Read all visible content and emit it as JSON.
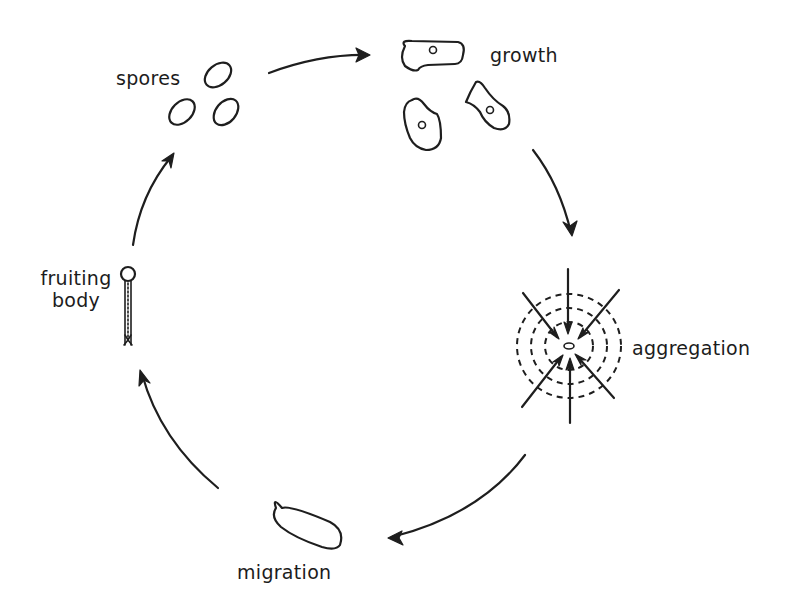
{
  "diagram": {
    "type": "life-cycle",
    "stages": [
      {
        "id": "spores",
        "label": "spores"
      },
      {
        "id": "growth",
        "label": "growth"
      },
      {
        "id": "aggregation",
        "label": "aggregation"
      },
      {
        "id": "migration",
        "label": "migration"
      },
      {
        "id": "fruiting-body",
        "label_line1": "fruiting",
        "label_line2": "body"
      }
    ],
    "edges": [
      {
        "from": "spores",
        "to": "growth"
      },
      {
        "from": "growth",
        "to": "aggregation"
      },
      {
        "from": "aggregation",
        "to": "migration"
      },
      {
        "from": "migration",
        "to": "fruiting-body"
      },
      {
        "from": "fruiting-body",
        "to": "spores"
      }
    ],
    "colors": {
      "ink": "#1e1e1e",
      "background": "#ffffff"
    }
  }
}
